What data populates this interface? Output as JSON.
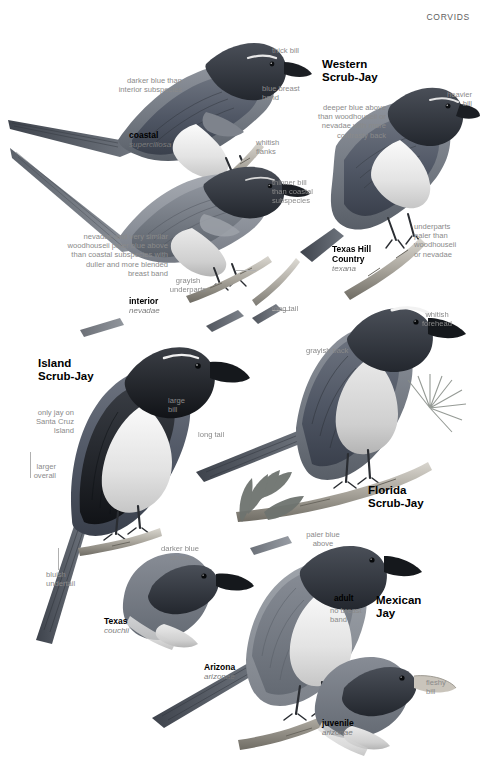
{
  "page": {
    "running_head": "CORVIDS",
    "width": 480,
    "height": 766,
    "background": "#ffffff",
    "annotation_color": "#8a8a8a",
    "label_color": "#000000",
    "sci_color": "#7b7b7b"
  },
  "species": [
    {
      "id": "western-scrub-jay",
      "name": "Western\nScrub-Jay",
      "name_line1": "Western",
      "name_line2": "Scrub-Jay",
      "forms": [
        {
          "label": "coastal",
          "scientific": "superciliosa"
        },
        {
          "label": "interior",
          "scientific": "nevadae"
        },
        {
          "label": "Texas Hill\nCountry",
          "label_line1": "Texas Hill",
          "label_line2": "Country",
          "scientific": "texana"
        }
      ],
      "annotations": [
        "thick bill",
        "blue breast\nband",
        "whitish\nflanks",
        "darker blue than\ninterior subspecies",
        "thinner bill\nthan coastal\nsubspecies",
        "nevadae and very similar\nwoodhouseii paler blue above\nthan coastal subspecies with\nduller and more blended\nbreast band",
        "grayish\nunderparts",
        "long tail",
        "deeper blue above\nthan woodhouseii or\nnevadae with more\ncontrasty back",
        "heavier\nbill",
        "underparts\npaler than\nwoodhouseii\nor nevadae"
      ]
    },
    {
      "id": "island-scrub-jay",
      "name_line1": "Island",
      "name_line2": "Scrub-Jay",
      "forms": [],
      "annotations": [
        "only jay on\nSanta Cruz\nIsland",
        "large\nbill",
        "larger\noverall",
        "bluish\nundertail"
      ]
    },
    {
      "id": "florida-scrub-jay",
      "name_line1": "Florida",
      "name_line2": "Scrub-Jay",
      "forms": [],
      "annotations": [
        "whitish\nforehead",
        "grayish back",
        "long tail"
      ]
    },
    {
      "id": "mexican-jay",
      "name_line1": "Mexican",
      "name_line2": "Jay",
      "forms": [
        {
          "label": "Texas",
          "scientific": "couchii"
        },
        {
          "label": "Arizona",
          "scientific": "arizonae"
        },
        {
          "label": "juvenile",
          "scientific": "arizonae"
        }
      ],
      "annotations": [
        "darker blue\nabove",
        "paler blue\nabove",
        "no breast\nband",
        "fleshy\nbill"
      ],
      "ages": [
        "adult",
        "juvenile"
      ]
    }
  ],
  "labels": {
    "running_head": "CORVIDS",
    "ws_name1": "Western",
    "ws_name2": "Scrub-Jay",
    "ws_thick_bill": "thick bill",
    "ws_blue_breast_1": "blue breast",
    "ws_blue_breast_2": "band",
    "ws_whitish_flanks_1": "whitish",
    "ws_whitish_flanks_2": "flanks",
    "ws_darker_blue_1": "darker blue than",
    "ws_darker_blue_2": "interior subspecies",
    "ws_coastal": "coastal",
    "ws_coastal_sci": "superciliosa",
    "ws_thinner_bill_1": "thinner bill",
    "ws_thinner_bill_2": "than coastal",
    "ws_thinner_bill_3": "subspecies",
    "ws_nevadae_1": "nevadae and very similar",
    "ws_nevadae_2": "woodhouseii paler blue above",
    "ws_nevadae_3": "than coastal subspecies with",
    "ws_nevadae_4": "duller and more blended",
    "ws_nevadae_5": "breast band",
    "ws_grayish_1": "grayish",
    "ws_grayish_2": "underparts",
    "ws_interior": "interior",
    "ws_interior_sci": "nevadae",
    "ws_long_tail": "long tail",
    "ws_deeper_1": "deeper blue above",
    "ws_deeper_2": "than woodhouseii or",
    "ws_deeper_3": "nevadae with more",
    "ws_deeper_4": "contrasty back",
    "ws_heavier_1": "heavier",
    "ws_heavier_2": "bill",
    "ws_underparts_1": "underparts",
    "ws_underparts_2": "paler than",
    "ws_underparts_3": "woodhouseii",
    "ws_underparts_4": "or nevadae",
    "ws_texas_1": "Texas Hill",
    "ws_texas_2": "Country",
    "ws_texas_sci": "texana",
    "is_name1": "Island",
    "is_name2": "Scrub-Jay",
    "is_only_1": "only jay on",
    "is_only_2": "Santa Cruz",
    "is_only_3": "Island",
    "is_large_bill_1": "large",
    "is_large_bill_2": "bill",
    "is_larger_1": "larger",
    "is_larger_2": "overall",
    "is_bluish_1": "bluish",
    "is_bluish_2": "undertail",
    "fl_name1": "Florida",
    "fl_name2": "Scrub-Jay",
    "fl_whitish_1": "whitish",
    "fl_whitish_2": "forehead",
    "fl_grayish": "grayish back",
    "fl_long_tail": "long tail",
    "mx_name1": "Mexican",
    "mx_name2": "Jay",
    "mx_darker_1": "darker blue",
    "mx_darker_2": "above",
    "mx_paler_1": "paler blue",
    "mx_paler_2": "above",
    "mx_texas": "Texas",
    "mx_texas_sci": "couchii",
    "mx_arizona": "Arizona",
    "mx_arizona_sci": "arizonae",
    "mx_adult": "adult",
    "mx_nobreast_1": "no breast",
    "mx_nobreast_2": "band",
    "mx_juvenile": "juvenile",
    "mx_juvenile_sci": "arizonae",
    "mx_fleshy_1": "fleshy",
    "mx_fleshy_2": "bill"
  }
}
